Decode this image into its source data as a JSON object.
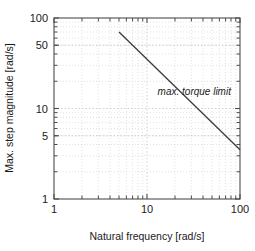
{
  "chart_data": {
    "type": "line",
    "title": "",
    "xlabel": "Natural frequency [rad/s]",
    "ylabel": "Max. step magnitude [rad/s]",
    "xscale": "log",
    "yscale": "log",
    "xlim": [
      1,
      100
    ],
    "ylim": [
      1,
      100
    ],
    "grid": true,
    "legend": null,
    "xticks_labeled": [
      1,
      10,
      100
    ],
    "xtick_labels": [
      "1",
      "10",
      "100"
    ],
    "yticks_labeled": [
      1,
      5,
      10,
      50,
      100
    ],
    "ytick_labels": [
      "1",
      "5",
      "10",
      "50",
      "100"
    ],
    "series": [
      {
        "name": "max. torque limit",
        "x": [
          5,
          100
        ],
        "y": [
          70,
          3.5
        ],
        "relation": "y = 350 / x",
        "slope_loglog": -1
      }
    ],
    "annotations": [
      {
        "text": "max. torque limit",
        "x": 13,
        "y": 14,
        "style": "italic"
      }
    ]
  },
  "axes": {
    "x_title": "Natural frequency [rad/s]",
    "y_title": "Max. step magnitude [rad/s]"
  },
  "ticks": {
    "x": [
      "1",
      "10",
      "100"
    ],
    "y": [
      "100",
      "50",
      "10",
      "5",
      "1"
    ]
  },
  "annotation": {
    "label": "max. torque limit"
  },
  "colors": {
    "line": "#3a3a3a",
    "frame": "#4d4d4d",
    "grid": "#cfcfcf",
    "text": "#1a1a1a",
    "background": "#ffffff"
  }
}
